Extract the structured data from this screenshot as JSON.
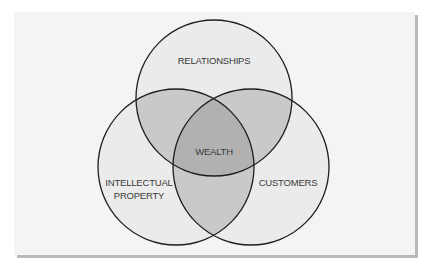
{
  "diagram": {
    "type": "venn",
    "sets": [
      {
        "id": "relationships",
        "label": "RELATIONSHIPS"
      },
      {
        "id": "intellectual_property",
        "label_lines": [
          "INTELLECTUAL",
          "PROPERTY"
        ]
      },
      {
        "id": "customers",
        "label": "CUSTOMERS"
      }
    ],
    "center_label": "WEALTH",
    "colors": {
      "panel_background": "#f4f4f4",
      "panel_shadow": "#b9b9b9",
      "single_region": "#ebebeb",
      "double_overlap": "#c9c9c9",
      "triple_overlap": "#b1b1b1",
      "outline": "#1e1e1e",
      "text": "#3a3a3a"
    }
  }
}
